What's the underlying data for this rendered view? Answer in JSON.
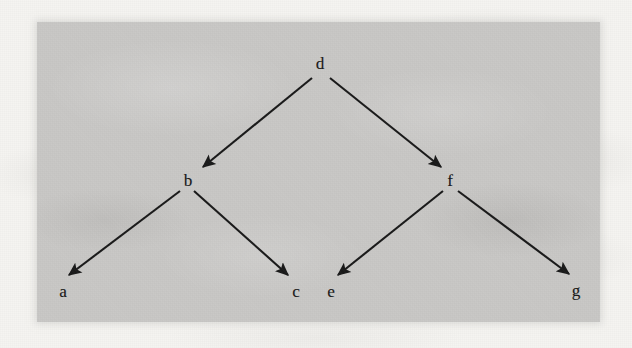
{
  "figure": {
    "kind": "binary-tree-diagram",
    "caption": "",
    "panel": {
      "x": 37,
      "y": 22,
      "width": 563,
      "height": 300,
      "fill": "#c9c8c6"
    },
    "page_background": "#f5f4f1",
    "ink_color": "#1a1a1a"
  },
  "chart_data": {
    "type": "diagram",
    "title": "",
    "layout": "binary tree, root at top, arrows directed parent to child",
    "nodes": [
      {
        "id": "d",
        "label": "d",
        "x": 320,
        "y": 63,
        "level": 0
      },
      {
        "id": "b",
        "label": "b",
        "x": 188,
        "y": 180,
        "level": 1
      },
      {
        "id": "f",
        "label": "f",
        "x": 450,
        "y": 180,
        "level": 1
      },
      {
        "id": "a",
        "label": "a",
        "x": 63,
        "y": 291,
        "level": 2
      },
      {
        "id": "c",
        "label": "c",
        "x": 296,
        "y": 291,
        "level": 2
      },
      {
        "id": "e",
        "label": "e",
        "x": 331,
        "y": 291,
        "level": 2
      },
      {
        "id": "g",
        "label": "g",
        "x": 576,
        "y": 290,
        "level": 2
      }
    ],
    "edges": [
      {
        "from": "d",
        "to": "b",
        "x1": 312,
        "y1": 78,
        "x2": 203,
        "y2": 167,
        "arrow": true
      },
      {
        "from": "d",
        "to": "f",
        "x1": 330,
        "y1": 78,
        "x2": 441,
        "y2": 167,
        "arrow": true
      },
      {
        "from": "b",
        "to": "a",
        "x1": 180,
        "y1": 191,
        "x2": 69,
        "y2": 275,
        "arrow": true
      },
      {
        "from": "b",
        "to": "c",
        "x1": 194,
        "y1": 191,
        "x2": 288,
        "y2": 275,
        "arrow": true
      },
      {
        "from": "f",
        "to": "e",
        "x1": 443,
        "y1": 191,
        "x2": 338,
        "y2": 275,
        "arrow": true
      },
      {
        "from": "f",
        "to": "g",
        "x1": 458,
        "y1": 191,
        "x2": 569,
        "y2": 274,
        "arrow": true
      }
    ]
  }
}
